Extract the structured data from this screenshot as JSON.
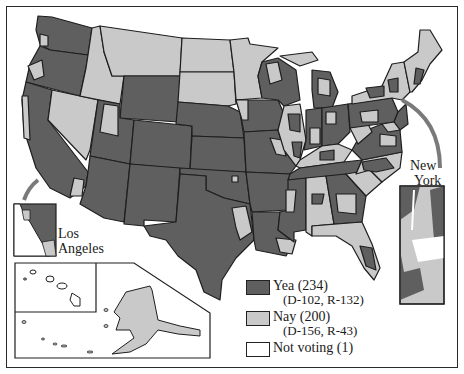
{
  "colors": {
    "yea": "#5f5f5f",
    "nay": "#c9c9c9",
    "not_voting": "#ffffff",
    "border": "#1e1e1e",
    "arrow": "#7a7a7a",
    "water": "#ffffff"
  },
  "callouts": {
    "los_angeles": [
      "Los",
      "Angeles"
    ],
    "new_york": [
      "New",
      "York"
    ]
  },
  "legend": {
    "items": [
      {
        "key": "yea",
        "label": "Yea (234)",
        "detail": "(D-102, R-132)"
      },
      {
        "key": "nay",
        "label": "Nay (200)",
        "detail": "(D-156, R-43)"
      },
      {
        "key": "not_voting",
        "label": "Not voting (1)",
        "detail": ""
      }
    ]
  },
  "insets": [
    "Los Angeles",
    "New York",
    "Hawaii",
    "Alaska"
  ]
}
